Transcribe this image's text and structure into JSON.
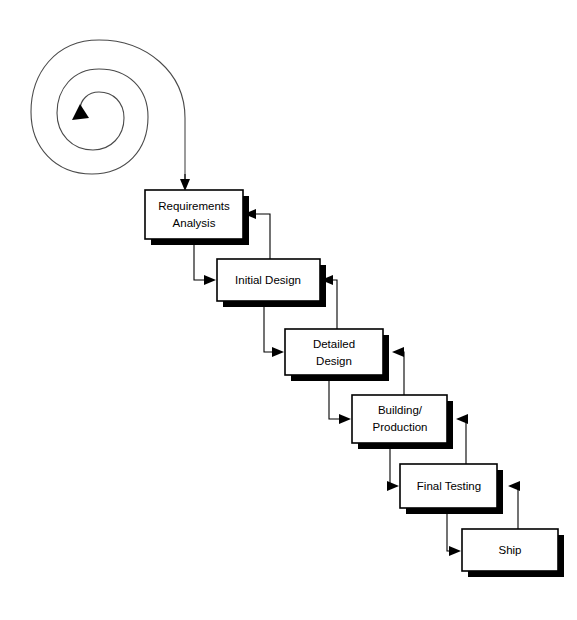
{
  "diagram": {
    "type": "process-flow",
    "canvas": {
      "width": 577,
      "height": 620
    },
    "colors": {
      "background": "#ffffff",
      "box_fill": "#ffffff",
      "box_stroke": "#000000",
      "box_shadow": "#000000",
      "connector": "#000000",
      "spiral_stroke": "#4a4a4a",
      "text": "#000000"
    },
    "spiral": {
      "name": "iteration-spiral",
      "turns": 3,
      "center": {
        "x": 86,
        "y": 112
      },
      "arrow_direction": "inward-counterclockwise",
      "exit_side": "right",
      "exit_line_x": 185,
      "exit_line_end_y": 188
    },
    "stages": [
      {
        "id": "requirements-analysis",
        "label_lines": [
          "Requirements",
          "Analysis"
        ],
        "x": 145,
        "y": 190,
        "width": 98,
        "height": 49,
        "shadow_offset": 6
      },
      {
        "id": "initial-design",
        "label_lines": [
          "Initial Design"
        ],
        "x": 217,
        "y": 259,
        "width": 103,
        "height": 42,
        "shadow_offset": 6
      },
      {
        "id": "detailed-design",
        "label_lines": [
          "Detailed",
          "Design"
        ],
        "x": 285,
        "y": 329,
        "width": 98,
        "height": 46,
        "shadow_offset": 6
      },
      {
        "id": "building-production",
        "label_lines": [
          "Building/",
          "Production"
        ],
        "x": 352,
        "y": 395,
        "width": 95,
        "height": 48,
        "shadow_offset": 6
      },
      {
        "id": "final-testing",
        "label_lines": [
          "Final Testing"
        ],
        "x": 400,
        "y": 464,
        "width": 97,
        "height": 44,
        "shadow_offset": 6
      },
      {
        "id": "ship",
        "label_lines": [
          "Ship"
        ],
        "x": 462,
        "y": 529,
        "width": 96,
        "height": 42,
        "shadow_offset": 6
      }
    ],
    "forward_flows": [
      {
        "from": "requirements-analysis",
        "to": "initial-design"
      },
      {
        "from": "initial-design",
        "to": "detailed-design"
      },
      {
        "from": "detailed-design",
        "to": "building-production"
      },
      {
        "from": "building-production",
        "to": "final-testing"
      },
      {
        "from": "final-testing",
        "to": "ship"
      }
    ],
    "feedback_flows": [
      {
        "from": "initial-design",
        "to": "requirements-analysis"
      },
      {
        "from": "detailed-design",
        "to": "initial-design"
      },
      {
        "from": "building-production",
        "to": "detailed-design"
      },
      {
        "from": "final-testing",
        "to": "building-production"
      },
      {
        "from": "ship",
        "to": "final-testing"
      }
    ]
  }
}
